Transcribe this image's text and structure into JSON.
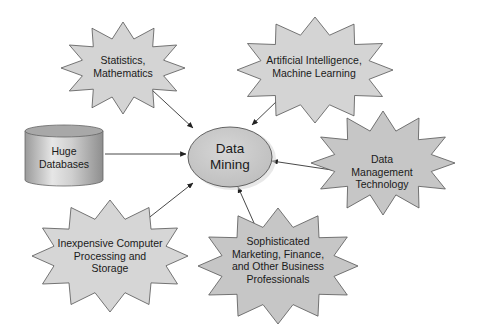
{
  "diagram": {
    "title": "",
    "center_node": {
      "id": "data-mining",
      "shape": "ellipse",
      "lines": [
        "Data",
        "Mining"
      ]
    },
    "nodes": [
      {
        "id": "statistics",
        "shape": "starburst",
        "lines": [
          "Statistics,",
          "Mathematics"
        ]
      },
      {
        "id": "ai",
        "shape": "starburst",
        "lines": [
          "Artificial Intelligence,",
          "Machine Learning"
        ]
      },
      {
        "id": "huge-databases",
        "shape": "cylinder",
        "lines": [
          "Huge",
          "Databases"
        ]
      },
      {
        "id": "data-management",
        "shape": "starburst",
        "lines": [
          "Data",
          "Management",
          "Technology"
        ]
      },
      {
        "id": "inexpensive-computing",
        "shape": "starburst",
        "lines": [
          "Inexpensive Computer",
          "Processing and",
          "Storage"
        ]
      },
      {
        "id": "business-professionals",
        "shape": "starburst",
        "lines": [
          "Sophisticated",
          "Marketing, Finance,",
          "and Other Business",
          "Professionals"
        ]
      }
    ],
    "edges": [
      {
        "from": "statistics",
        "to": "data-mining"
      },
      {
        "from": "ai",
        "to": "data-mining"
      },
      {
        "from": "huge-databases",
        "to": "data-mining"
      },
      {
        "from": "data-management",
        "to": "data-mining"
      },
      {
        "from": "inexpensive-computing",
        "to": "data-mining"
      },
      {
        "from": "business-professionals",
        "to": "data-mining"
      }
    ],
    "colors": {
      "starburst_fill": "#d4d4d4",
      "starburst_stroke": "#555555",
      "ellipse_fill": "#c8c8c8",
      "cylinder_fill": "#bdbdbd",
      "arrow": "#333333",
      "text": "#1a1a1a"
    }
  }
}
